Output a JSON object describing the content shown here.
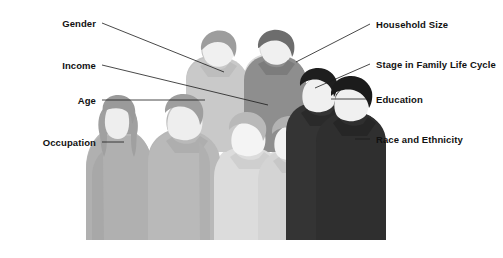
{
  "figure": {
    "background_color": "#ffffff",
    "group_silhouette_name": "group-of-people-silhouette"
  },
  "labels_left": [
    {
      "name": "gender",
      "text": "Gender",
      "text_x": 96,
      "text_y": 25,
      "line_x1": 102,
      "line_y1": 23,
      "line_x2": 224,
      "line_y2": 72
    },
    {
      "name": "income",
      "text": "Income",
      "text_x": 96,
      "text_y": 67,
      "line_x1": 102,
      "line_y1": 65,
      "line_x2": 268,
      "line_y2": 105
    },
    {
      "name": "age",
      "text": "Age",
      "text_x": 96,
      "text_y": 101,
      "line_x1": 102,
      "line_y1": 100,
      "line_x2": 205,
      "line_y2": 100
    },
    {
      "name": "occupation",
      "text": "Occupation",
      "text_x": 96,
      "text_y": 143,
      "line_x1": 102,
      "line_y1": 142,
      "line_x2": 124,
      "line_y2": 142
    }
  ],
  "labels_right": [
    {
      "name": "household-size",
      "text": "Household Size",
      "text_x": 376,
      "text_y": 25,
      "line_x1": 370,
      "line_y1": 24,
      "line_x2": 296,
      "line_y2": 62
    },
    {
      "name": "stage-in-family-life-cycle",
      "text": "Stage in Family Life Cycle",
      "text_x": 376,
      "text_y": 65,
      "line_x1": 370,
      "line_y1": 64,
      "line_x2": 315,
      "line_y2": 88
    },
    {
      "name": "education",
      "text": "Education",
      "text_x": 376,
      "text_y": 100,
      "line_x1": 370,
      "line_y1": 99,
      "line_x2": 331,
      "line_y2": 99
    },
    {
      "name": "race-and-ethnicity",
      "text": "Race and Ethnicity",
      "text_x": 376,
      "text_y": 140,
      "line_x1": 370,
      "line_y1": 139,
      "line_x2": 355,
      "line_y2": 139
    }
  ],
  "colors": {
    "line": "#1a1a1a",
    "text": "#111111",
    "band_1": "#b4b4b4",
    "band_2": "#c2c2c2",
    "band_3": "#dcdcdc",
    "band_4": "#3a3a3a",
    "face_light": "#f2f2f2",
    "hair_mid": "#9a9a9a",
    "hair_dark": "#6e6e6e",
    "hair_black": "#1f1f1f",
    "body_back_left": "#d8d8d8",
    "body_back_right": "#8f8f8f"
  },
  "people": [
    {
      "name": "person-back-left-raised",
      "role": "back row left",
      "tone": "light-gray"
    },
    {
      "name": "person-back-right-raised",
      "role": "back row right",
      "tone": "mid-gray"
    },
    {
      "name": "person-far-left-long-hair",
      "role": "front row far left",
      "tone": "mid-gray"
    },
    {
      "name": "person-left-center",
      "role": "front row left-center",
      "tone": "mid-gray"
    },
    {
      "name": "person-center",
      "role": "front row center",
      "tone": "light-gray"
    },
    {
      "name": "person-right-center",
      "role": "front row right-center",
      "tone": "light-gray"
    },
    {
      "name": "person-right-dark",
      "role": "right dark figure",
      "tone": "dark"
    },
    {
      "name": "person-far-right-dark",
      "role": "far right dark figure",
      "tone": "dark"
    }
  ]
}
